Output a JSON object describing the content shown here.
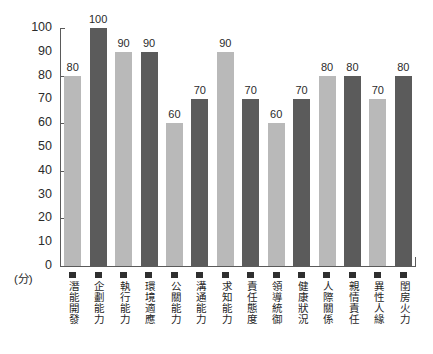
{
  "chart_data": {
    "type": "bar",
    "title": "",
    "xlabel": "",
    "ylabel": "(分)",
    "ylim": [
      0,
      100
    ],
    "grid": false,
    "legend": "none",
    "unit_label": "(分)",
    "y_ticks": [
      {
        "value": 100,
        "label": "100",
        "major": true
      },
      {
        "value": 90,
        "label": "90",
        "major": false
      },
      {
        "value": 80,
        "label": "80",
        "major": true
      },
      {
        "value": 70,
        "label": "70",
        "major": false
      },
      {
        "value": 60,
        "label": "60",
        "major": true
      },
      {
        "value": 50,
        "label": "50",
        "major": false
      },
      {
        "value": 40,
        "label": "40",
        "major": true
      },
      {
        "value": 30,
        "label": "30",
        "major": false
      },
      {
        "value": 20,
        "label": "20",
        "major": true
      },
      {
        "value": 10,
        "label": "10",
        "major": false
      },
      {
        "value": 0,
        "label": "0",
        "major": true
      }
    ],
    "categories": [
      "潛能開發",
      "企劃能力",
      "執行能力",
      "環境適應",
      "公關能力",
      "溝通能力",
      "求知能力",
      "責任態度",
      "領導統御",
      "健康狀況",
      "人際關係",
      "親情責任",
      "異性人緣",
      "閨房火力"
    ],
    "values": [
      80,
      100,
      90,
      90,
      60,
      70,
      90,
      70,
      60,
      70,
      80,
      80,
      70,
      80
    ],
    "value_labels": [
      "80",
      "100",
      "90",
      "90",
      "60",
      "70",
      "90",
      "70",
      "60",
      "70",
      "80",
      "80",
      "70",
      "80"
    ],
    "bar_colors": [
      "#b9b9b9",
      "#5b5b5b",
      "#b9b9b9",
      "#5b5b5b",
      "#b9b9b9",
      "#5b5b5b",
      "#b9b9b9",
      "#5b5b5b",
      "#b9b9b9",
      "#5b5b5b",
      "#b9b9b9",
      "#5b5b5b",
      "#b9b9b9",
      "#5b5b5b"
    ],
    "color_light": "#b9b9b9",
    "color_dark": "#5b5b5b",
    "axis_color": "#5a5a5a",
    "text_color": "#2b2b2b",
    "background": "#ffffff"
  }
}
